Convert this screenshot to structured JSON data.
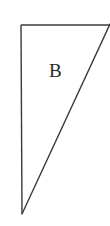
{
  "figure": {
    "name": "right-triangle-region-b",
    "width": 226,
    "height": 226,
    "background_color": "#ffffff",
    "line_color": "#3a3a3a",
    "line_width": 1.4,
    "labels": [
      {
        "id": "label-b",
        "text": "B",
        "x": 56,
        "y": 70,
        "font_size": 19,
        "color": "#2b2b2b"
      }
    ],
    "edges": [
      {
        "name": "top-horizontal-edge",
        "kind": "solid",
        "x1": 21,
        "y1": 25,
        "x2": 110,
        "y2": 25
      },
      {
        "name": "left-vertical-edge",
        "kind": "solid",
        "x1": 21,
        "y1": 25,
        "x2": 22,
        "y2": 214
      },
      {
        "name": "hypotenuse-edge",
        "kind": "solid",
        "x1": 22,
        "y1": 214,
        "x2": 110,
        "y2": 24
      }
    ],
    "vertices": [
      {
        "name": "top-left-vertex",
        "x": 21,
        "y": 25
      },
      {
        "name": "bottom-vertex",
        "x": 22,
        "y": 214
      },
      {
        "name": "top-right-vertex",
        "x": 110,
        "y": 24
      }
    ]
  }
}
